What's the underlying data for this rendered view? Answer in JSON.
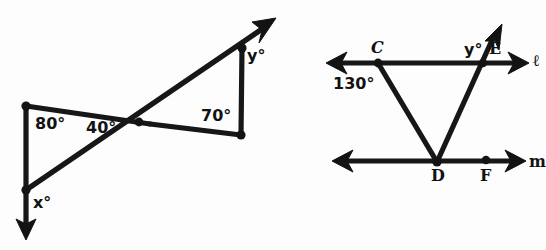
{
  "figure": {
    "caption": "Two geometry diagrams: intersecting transversal triangle pair, and two parallel lines cut by segments",
    "background_color": "#fdfdfd",
    "ink_color": "#131313"
  },
  "diagram_left": {
    "name": "intersecting-segments-bowtie",
    "labels": {
      "angle_80": "80°",
      "angle_40": "40°",
      "angle_70": "70°",
      "angle_x": "x°",
      "angle_y": "y°"
    },
    "points": {
      "top_left": [
        26,
        106
      ],
      "bottom_left": [
        26,
        190
      ],
      "center": [
        133,
        121
      ],
      "top_right": [
        242,
        48
      ],
      "bottom_right": [
        241,
        135
      ],
      "arrow_tip_up_right": [
        274,
        19
      ],
      "arrow_tip_down_left": [
        26,
        237
      ]
    }
  },
  "diagram_right": {
    "name": "parallel-lines-with-transversals",
    "labels": {
      "point_c": "C",
      "point_d": "D",
      "point_e": "E",
      "point_f": "F",
      "line_l": "ℓ",
      "line_m": "m",
      "angle_130": "130°",
      "angle_y": "y°"
    },
    "points": {
      "c": [
        378,
        63
      ],
      "e": [
        483,
        63
      ],
      "d": [
        437,
        162
      ],
      "f": [
        486,
        161
      ],
      "line_l_left_arrow_tip": [
        327,
        63
      ],
      "line_l_right_arrow_tip": [
        527,
        63
      ],
      "line_m_left_arrow_tip": [
        333,
        161
      ],
      "line_m_right_arrow_tip": [
        524,
        161
      ],
      "ray_up_arrow_tip": [
        501,
        26
      ]
    }
  }
}
